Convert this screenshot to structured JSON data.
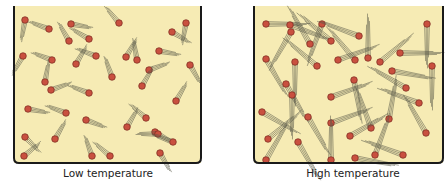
{
  "colors": {
    "fill": "#f6ebb4",
    "wall": "#1a1a1a",
    "molecule": "#c9503f",
    "molecule_edge": "#7a2a20",
    "trail": "#5a5a4a"
  },
  "panels": [
    {
      "id": "low",
      "caption": "Low temperature",
      "box": {
        "x": 14,
        "y": 6,
        "w": 187,
        "h": 157
      },
      "caption_x": 108,
      "trail_len": 22,
      "molecules": [
        [
          25,
          20,
          100
        ],
        [
          49,
          29,
          200
        ],
        [
          71,
          24,
          10
        ],
        [
          69,
          41,
          240
        ],
        [
          89,
          39,
          210
        ],
        [
          96,
          56,
          200
        ],
        [
          119,
          23,
          230
        ],
        [
          172,
          32,
          30
        ],
        [
          186,
          23,
          100
        ],
        [
          23,
          56,
          120
        ],
        [
          52,
          60,
          200
        ],
        [
          76,
          64,
          300
        ],
        [
          126,
          57,
          300
        ],
        [
          137,
          60,
          260
        ],
        [
          159,
          51,
          10
        ],
        [
          149,
          70,
          340
        ],
        [
          45,
          82,
          280
        ],
        [
          51,
          90,
          340
        ],
        [
          89,
          93,
          200
        ],
        [
          112,
          77,
          250
        ],
        [
          142,
          86,
          300
        ],
        [
          190,
          65,
          60
        ],
        [
          176,
          101,
          300
        ],
        [
          28,
          109,
          10
        ],
        [
          66,
          113,
          200
        ],
        [
          86,
          120,
          20
        ],
        [
          127,
          127,
          300
        ],
        [
          146,
          118,
          220
        ],
        [
          155,
          132,
          30
        ],
        [
          25,
          137,
          45
        ],
        [
          55,
          139,
          300
        ],
        [
          92,
          156,
          250
        ],
        [
          110,
          156,
          220
        ],
        [
          158,
          134,
          180
        ],
        [
          173,
          142,
          200
        ],
        [
          24,
          156,
          320
        ],
        [
          160,
          153,
          60
        ]
      ]
    },
    {
      "id": "high",
      "caption": "High temperature",
      "box": {
        "x": 254,
        "y": 6,
        "w": 189,
        "h": 157
      },
      "caption_x": 353,
      "trail_len": 44,
      "molecules": [
        [
          266,
          24,
          0
        ],
        [
          290,
          25,
          20
        ],
        [
          322,
          24,
          110
        ],
        [
          359,
          36,
          200
        ],
        [
          427,
          24,
          90
        ],
        [
          291,
          32,
          120
        ],
        [
          310,
          44,
          240
        ],
        [
          331,
          41,
          220
        ],
        [
          266,
          59,
          60
        ],
        [
          295,
          62,
          90
        ],
        [
          338,
          60,
          340
        ],
        [
          355,
          60,
          230
        ],
        [
          368,
          58,
          270
        ],
        [
          380,
          62,
          320
        ],
        [
          400,
          53,
          0
        ],
        [
          432,
          66,
          90
        ],
        [
          317,
          66,
          220
        ],
        [
          286,
          84,
          60
        ],
        [
          354,
          80,
          80
        ],
        [
          392,
          71,
          10
        ],
        [
          406,
          88,
          210
        ],
        [
          292,
          95,
          90
        ],
        [
          331,
          97,
          340
        ],
        [
          262,
          112,
          30
        ],
        [
          308,
          117,
          60
        ],
        [
          331,
          123,
          340
        ],
        [
          371,
          128,
          250
        ],
        [
          389,
          119,
          280
        ],
        [
          419,
          103,
          200
        ],
        [
          268,
          139,
          320
        ],
        [
          298,
          142,
          60
        ],
        [
          350,
          136,
          330
        ],
        [
          426,
          133,
          240
        ],
        [
          403,
          155,
          200
        ],
        [
          266,
          160,
          300
        ],
        [
          331,
          160,
          270
        ],
        [
          355,
          158,
          10
        ],
        [
          375,
          155,
          290
        ]
      ]
    }
  ]
}
